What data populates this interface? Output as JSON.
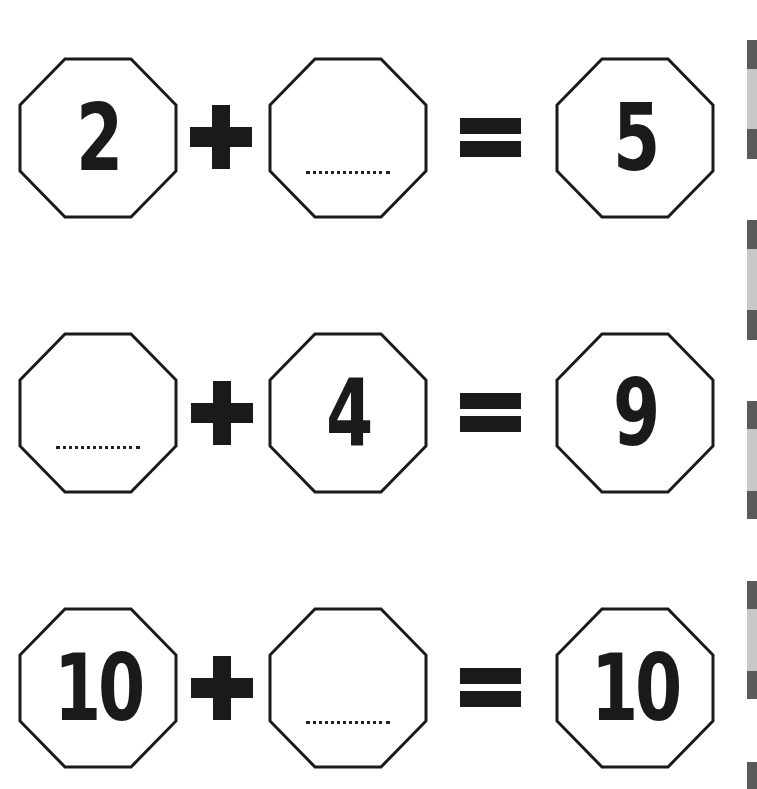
{
  "worksheet": {
    "equations": [
      {
        "a": "2",
        "a_blank": false,
        "op": "+",
        "b": "",
        "b_blank": true,
        "eq": "=",
        "c": "5"
      },
      {
        "a": "",
        "a_blank": true,
        "op": "+",
        "b": "4",
        "b_blank": false,
        "eq": "=",
        "c": "9"
      },
      {
        "a": "10",
        "a_blank": false,
        "op": "+",
        "b": "",
        "b_blank": true,
        "eq": "=",
        "c": "10"
      }
    ]
  },
  "colors": {
    "ink": "#1a1a1a",
    "strip_dark": "#5a5a5a",
    "strip_light": "#c8c8c8"
  }
}
